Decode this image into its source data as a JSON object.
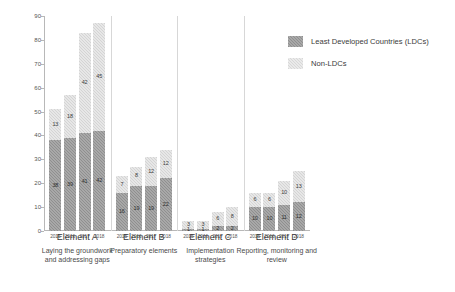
{
  "chart_data": {
    "type": "bar",
    "title": "",
    "xlabel": "",
    "ylabel": "Number of Developing Country Parties",
    "ylim": [
      0,
      90
    ],
    "ytick_step": 10,
    "yticks": [
      0,
      10,
      20,
      30,
      40,
      50,
      60,
      70,
      80,
      90
    ],
    "grid": false,
    "stacked": true,
    "legend_position": "top-right",
    "categories": [
      "2015",
      "2016",
      "2017",
      "2018"
    ],
    "groups": [
      {
        "id": "element-a",
        "label": "Element A",
        "sublabel": "Laying the groundwork\nand addressing gaps",
        "sublabel_line1": "Laying the groundwork",
        "sublabel_line2": "and addressing gaps",
        "years": [
          "2015",
          "2016",
          "2017",
          "2018"
        ],
        "ldc": [
          38,
          39,
          41,
          42
        ],
        "non_ldc": [
          13,
          18,
          42,
          45
        ],
        "totals": [
          51,
          57,
          83,
          87
        ]
      },
      {
        "id": "element-b",
        "label": "Element B",
        "sublabel": "Preparatory elements",
        "sublabel_line1": "Preparatory elements",
        "sublabel_line2": "",
        "years": [
          "2015",
          "2016",
          "2017",
          "2018"
        ],
        "ldc": [
          16,
          19,
          19,
          22
        ],
        "non_ldc": [
          7,
          8,
          12,
          12
        ],
        "totals": [
          23,
          27,
          31,
          34
        ]
      },
      {
        "id": "element-c",
        "label": "Element C",
        "sublabel": "Implementation\nstrategies",
        "sublabel_line1": "Implementation",
        "sublabel_line2": "strategies",
        "years": [
          "2015",
          "2016",
          "2017",
          "2018"
        ],
        "ldc": [
          1,
          1,
          2,
          2
        ],
        "non_ldc": [
          3,
          3,
          6,
          8
        ],
        "totals": [
          4,
          4,
          8,
          10
        ]
      },
      {
        "id": "element-d",
        "label": "Element D",
        "sublabel": "Reporting, monitoring and\nreview",
        "sublabel_line1": "Reporting, monitoring and",
        "sublabel_line2": "review",
        "years": [
          "2015",
          "2016",
          "2017",
          "2018"
        ],
        "ldc": [
          10,
          10,
          11,
          12
        ],
        "non_ldc": [
          6,
          6,
          10,
          13
        ],
        "totals": [
          16,
          16,
          21,
          25
        ]
      }
    ],
    "series": [
      {
        "name": "Least Developed Countries (LDCs)",
        "key": "ldc",
        "color": "#8f8f8f"
      },
      {
        "name": "Non-LDCs",
        "key": "non_ldc",
        "color": "#d4d4d4"
      }
    ]
  },
  "legend": {
    "items": [
      {
        "label": "Least Developed Countries (LDCs)",
        "style": "dark"
      },
      {
        "label": "Non-LDCs",
        "style": "light"
      }
    ]
  },
  "colors": {
    "ldc": "#8f8f8f",
    "non_ldc": "#d4d4d4",
    "axis": "#b8b8b8",
    "text": "#3a3a3a",
    "background": "#ffffff"
  }
}
